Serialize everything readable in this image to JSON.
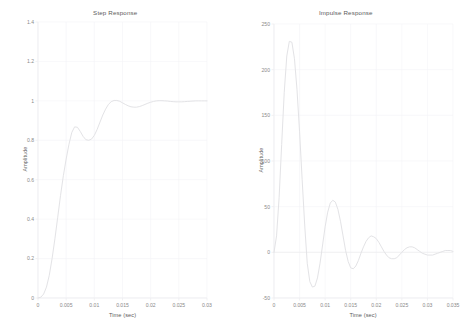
{
  "figure": {
    "background": "#ffffff",
    "line_color": "#e3e3e6",
    "grid_color": "#f4f4f6",
    "axis_color": "#ededf0",
    "tick_color": "#8a8a8a"
  },
  "panels": [
    {
      "name": "step-response",
      "title": "Step Response",
      "xlabel": "Time (sec)",
      "ylabel": "Amplitude"
    },
    {
      "name": "impulse-response",
      "title": "Impulse Response",
      "xlabel": "Time (sec)",
      "ylabel": "Amplitude"
    }
  ],
  "chart_data": [
    {
      "type": "line",
      "name": "step-response",
      "title": "Step Response",
      "xlabel": "Time (sec)",
      "ylabel": "Amplitude",
      "xlim": [
        0,
        0.03
      ],
      "ylim": [
        0,
        1.4
      ],
      "xticks": [
        0,
        0.005,
        0.01,
        0.015,
        0.02,
        0.025,
        0.03
      ],
      "xticklabels": [
        "0",
        "0.005",
        "0.01",
        "0.015",
        "0.02",
        "0.025",
        "0.03"
      ],
      "yticks": [
        0,
        0.2,
        0.4,
        0.6,
        0.8,
        1,
        1.2,
        1.4
      ],
      "yticklabels": [
        "0",
        "0.2",
        "0.4",
        "0.6",
        "0.8",
        "1",
        "1.2",
        "1.4"
      ],
      "grid": true,
      "legend": null,
      "line_color": "#e3e3e6",
      "x": [
        0,
        0.0005,
        0.001,
        0.0015,
        0.002,
        0.0025,
        0.003,
        0.0035,
        0.004,
        0.0045,
        0.005,
        0.0055,
        0.006,
        0.0065,
        0.007,
        0.0075,
        0.008,
        0.0085,
        0.009,
        0.0095,
        0.01,
        0.0105,
        0.011,
        0.0115,
        0.012,
        0.0125,
        0.013,
        0.0135,
        0.014,
        0.0145,
        0.015,
        0.0155,
        0.016,
        0.0165,
        0.017,
        0.0175,
        0.018,
        0.0185,
        0.019,
        0.0195,
        0.02,
        0.0205,
        0.021,
        0.0215,
        0.022,
        0.0225,
        0.023,
        0.0235,
        0.024,
        0.0245,
        0.025,
        0.0255,
        0.026,
        0.0265,
        0.027,
        0.0275,
        0.028,
        0.0285,
        0.029,
        0.0295,
        0.03
      ],
      "y": [
        0,
        0.004,
        0.02,
        0.055,
        0.115,
        0.2,
        0.3,
        0.41,
        0.52,
        0.62,
        0.705,
        0.78,
        0.84,
        0.868,
        0.866,
        0.845,
        0.82,
        0.803,
        0.8,
        0.806,
        0.825,
        0.855,
        0.892,
        0.928,
        0.958,
        0.982,
        0.996,
        1.002,
        1.002,
        0.998,
        0.99,
        0.982,
        0.975,
        0.97,
        0.968,
        0.968,
        0.971,
        0.976,
        0.982,
        0.988,
        0.993,
        0.997,
        1.0,
        1.001,
        1.001,
        1.0,
        0.999,
        0.997,
        0.996,
        0.995,
        0.995,
        0.995,
        0.996,
        0.997,
        0.998,
        0.999,
        1.0,
        1.0,
        1.0,
        1.0,
        1.0
      ],
      "annotations": {
        "first_overshoot_peak": {
          "t": 0.0065,
          "value": 0.868
        },
        "first_trough": {
          "t": 0.009,
          "value": 0.8
        },
        "second_peak": {
          "t": 0.0135,
          "value": 1.002
        },
        "steady_state": 1.0
      }
    },
    {
      "type": "line",
      "name": "impulse-response",
      "title": "Impulse Response",
      "xlabel": "Time (sec)",
      "ylabel": "Amplitude",
      "xlim": [
        0,
        0.035
      ],
      "ylim": [
        -50,
        250
      ],
      "xticks": [
        0,
        0.005,
        0.01,
        0.015,
        0.02,
        0.025,
        0.03,
        0.035
      ],
      "xticklabels": [
        "0",
        "0.005",
        "0.01",
        "0.015",
        "0.02",
        "0.025",
        "0.03",
        "0.035"
      ],
      "yticks": [
        -50,
        0,
        50,
        100,
        150,
        200,
        250
      ],
      "yticklabels": [
        "-50",
        "0",
        "50",
        "100",
        "150",
        "200",
        "250"
      ],
      "grid": true,
      "legend": null,
      "line_color": "#e3e3e6",
      "x": [
        0,
        0.0005,
        0.001,
        0.0015,
        0.002,
        0.0025,
        0.003,
        0.0035,
        0.004,
        0.0045,
        0.005,
        0.0055,
        0.006,
        0.0065,
        0.007,
        0.0075,
        0.008,
        0.0085,
        0.009,
        0.0095,
        0.01,
        0.0105,
        0.011,
        0.0115,
        0.012,
        0.0125,
        0.013,
        0.0135,
        0.014,
        0.0145,
        0.015,
        0.0155,
        0.016,
        0.0165,
        0.017,
        0.0175,
        0.018,
        0.0185,
        0.019,
        0.0195,
        0.02,
        0.0205,
        0.021,
        0.0215,
        0.022,
        0.0225,
        0.023,
        0.0235,
        0.024,
        0.0245,
        0.025,
        0.0255,
        0.026,
        0.0265,
        0.027,
        0.0275,
        0.028,
        0.0285,
        0.029,
        0.0295,
        0.03,
        0.0305,
        0.031,
        0.0315,
        0.032,
        0.0325,
        0.033,
        0.0335,
        0.034,
        0.0345,
        0.035
      ],
      "y": [
        0,
        18,
        60,
        118,
        175,
        215,
        231,
        230,
        212,
        178,
        132,
        80,
        30,
        -12,
        -32,
        -38,
        -37,
        -28,
        -12,
        8,
        28,
        44,
        54,
        57,
        55,
        47,
        34,
        18,
        2,
        -10,
        -17,
        -18,
        -15,
        -9,
        -1,
        6,
        12,
        16,
        18,
        17,
        15,
        11,
        6,
        1,
        -3,
        -6,
        -7,
        -7,
        -6,
        -3,
        0,
        3,
        5,
        6,
        6,
        5,
        3,
        1,
        -1,
        -2,
        -3,
        -3,
        -3,
        -2,
        -1,
        0,
        1,
        2,
        2,
        2,
        1
      ],
      "annotations": {
        "peak": {
          "t": 0.003,
          "value": 231
        },
        "first_trough": {
          "t": 0.0075,
          "value": -38
        },
        "second_peak": {
          "t": 0.0115,
          "value": 57
        },
        "second_trough": {
          "t": 0.0155,
          "value": -18
        },
        "third_peak": {
          "t": 0.019,
          "value": 18
        },
        "settles_to": 0
      }
    }
  ]
}
